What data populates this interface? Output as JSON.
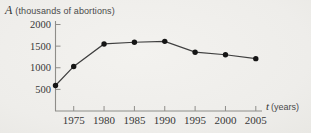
{
  "title": {
    "symbol": "A",
    "text": "(thousands of abortions)"
  },
  "x_axis_label": {
    "symbol": "t",
    "text": "(years)"
  },
  "chart_data": {
    "type": "line",
    "title": "A (thousands of abortions)",
    "xlabel": "t (years)",
    "ylabel": "A (thousands of abortions)",
    "x": [
      1972,
      1975,
      1980,
      1985,
      1990,
      1995,
      2000,
      2005
    ],
    "values": [
      590,
      1030,
      1550,
      1590,
      1610,
      1360,
      1300,
      1210
    ],
    "x_ticks": [
      1975,
      1980,
      1985,
      1990,
      1995,
      2000,
      2005
    ],
    "y_ticks": [
      500,
      1000,
      1500,
      2000
    ],
    "xlim": [
      1972,
      2006
    ],
    "ylim": [
      0,
      2000
    ],
    "grid": false,
    "legend": "none",
    "marker": "filled-circle",
    "line_color": "#3f3f3f",
    "marker_color": "#151515",
    "axis_color": "#8e8d89",
    "tick_text_color": "#383838"
  },
  "colors": {
    "background": "#efeeea",
    "title_text": "#4a4a4a"
  }
}
